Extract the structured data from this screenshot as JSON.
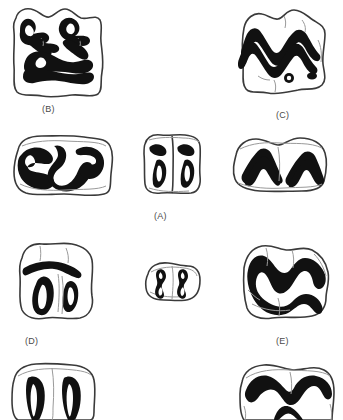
{
  "figure": {
    "type": "scientific-illustration-plate",
    "background_color": "#ffffff",
    "enamel_color": "#111111",
    "outline_color": "#3a3a3a",
    "crease_color": "#9a9a9a",
    "label_color": "#4a4a4a",
    "panel_count": 5,
    "specimen_count": 9
  },
  "labels": [
    {
      "id": "label-a",
      "text": "(A)",
      "x": 154,
      "y": 211
    },
    {
      "id": "label-b",
      "text": "(B)",
      "x": 42,
      "y": 104
    },
    {
      "id": "label-c",
      "text": "(C)",
      "x": 276,
      "y": 110
    },
    {
      "id": "label-d",
      "text": "(D)",
      "x": 25,
      "y": 336
    },
    {
      "id": "label-e",
      "text": "(E)",
      "x": 276,
      "y": 336
    }
  ],
  "specimens": [
    {
      "id": "specimen-b-upper",
      "panel": "B",
      "position": "top-left",
      "description": "complex multi-lophed molar with W-shaped ectoloph and branching enamel lakes",
      "x": 8,
      "y": 4,
      "width": 100,
      "height": 96
    },
    {
      "id": "specimen-c-upper",
      "panel": "C",
      "position": "top-right",
      "description": "selenodont molar with double W-shaped ectoloph crest and two root foramina",
      "x": 228,
      "y": 6,
      "width": 104,
      "height": 94
    },
    {
      "id": "specimen-b-lower",
      "panel": "B",
      "position": "middle-left",
      "description": "bilobed lower molar with S-shaped paired enamel loops",
      "x": 8,
      "y": 132,
      "width": 110,
      "height": 66
    },
    {
      "id": "specimen-a-center",
      "panel": "A",
      "position": "middle-center",
      "description": "small squared molar with two teardrop enamel lakes and apical pits",
      "x": 137,
      "y": 130,
      "width": 70,
      "height": 70
    },
    {
      "id": "specimen-c-lower",
      "panel": "C",
      "position": "middle-right",
      "description": "bilobed lower molar with paired chevron V-shaped enamel crests",
      "x": 228,
      "y": 133,
      "width": 104,
      "height": 62
    },
    {
      "id": "specimen-d-upper",
      "panel": "D",
      "position": "lower-left",
      "description": "quadrate molar with transverse anterior crest and two teardrop enamel lakes",
      "x": 12,
      "y": 238,
      "width": 86,
      "height": 88
    },
    {
      "id": "specimen-a-small",
      "panel": "A",
      "position": "lower-center",
      "description": "small two-lobed premolar with two narrow hourglass enamel lakes",
      "x": 142,
      "y": 258,
      "width": 62,
      "height": 48
    },
    {
      "id": "specimen-e-upper",
      "panel": "E",
      "position": "lower-right",
      "description": "triangular molar with continuous zigzag enamel crest",
      "x": 230,
      "y": 240,
      "width": 104,
      "height": 88
    },
    {
      "id": "specimen-d-lower",
      "panel": "D",
      "position": "bottom-left",
      "description": "bilobed lower molar with two elongate enamel loops, cropped at image edge",
      "x": 6,
      "y": 360,
      "width": 98,
      "height": 60
    },
    {
      "id": "specimen-e-lower",
      "panel": "E",
      "position": "bottom-right",
      "description": "bilobed lower molar with broad anterior enamel crest, cropped at image edge",
      "x": 232,
      "y": 360,
      "width": 104,
      "height": 60
    }
  ]
}
